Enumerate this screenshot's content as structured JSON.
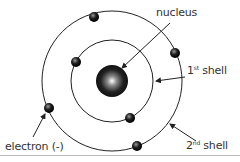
{
  "diagram": {
    "labels": {
      "nucleus": "nucleus",
      "shell1_num": "1",
      "shell1_sup": "st",
      "shell1_word": " shell",
      "shell2_num": "2",
      "shell2_sup": "nd",
      "shell2_word": " shell",
      "electron": "electron (-)"
    },
    "colors": {
      "line": "#222222",
      "text": "#333333"
    }
  }
}
